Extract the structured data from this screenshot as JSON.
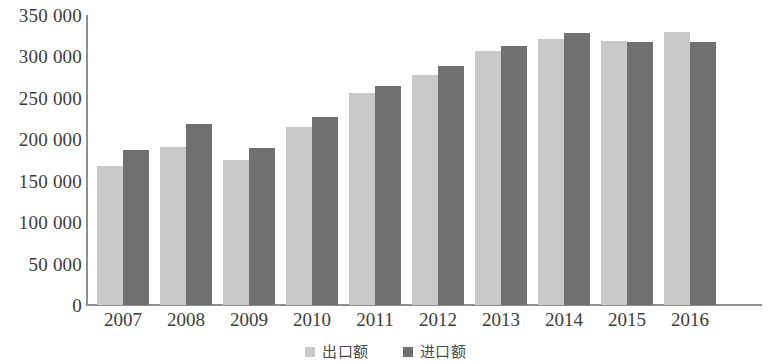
{
  "chart_data": {
    "type": "bar",
    "title": "",
    "xlabel": "",
    "ylabel": "",
    "grid": false,
    "legend_position": "bottom-center",
    "categories": [
      "2007",
      "2008",
      "2009",
      "2010",
      "2011",
      "2012",
      "2013",
      "2014",
      "2015",
      "2016"
    ],
    "ylim": [
      0,
      350000
    ],
    "y_ticks": [
      0,
      50000,
      100000,
      150000,
      200000,
      250000,
      300000,
      350000
    ],
    "y_tick_labels": [
      "0",
      "50 000",
      "100 000",
      "150 000",
      "200 000",
      "250 000",
      "300 000",
      "350 000"
    ],
    "series": [
      {
        "name": "出口额",
        "color": "#c9c9c9",
        "values": [
          168000,
          191000,
          175000,
          215000,
          256000,
          278000,
          306000,
          321000,
          319000,
          329000
        ]
      },
      {
        "name": "进口额",
        "color": "#707070",
        "values": [
          187000,
          219000,
          190000,
          227000,
          264000,
          288000,
          313000,
          328000,
          317000,
          318000
        ]
      }
    ]
  },
  "legend": {
    "items": [
      {
        "label": "出口额",
        "color": "#c9c9c9"
      },
      {
        "label": "进口额",
        "color": "#707070"
      }
    ]
  }
}
